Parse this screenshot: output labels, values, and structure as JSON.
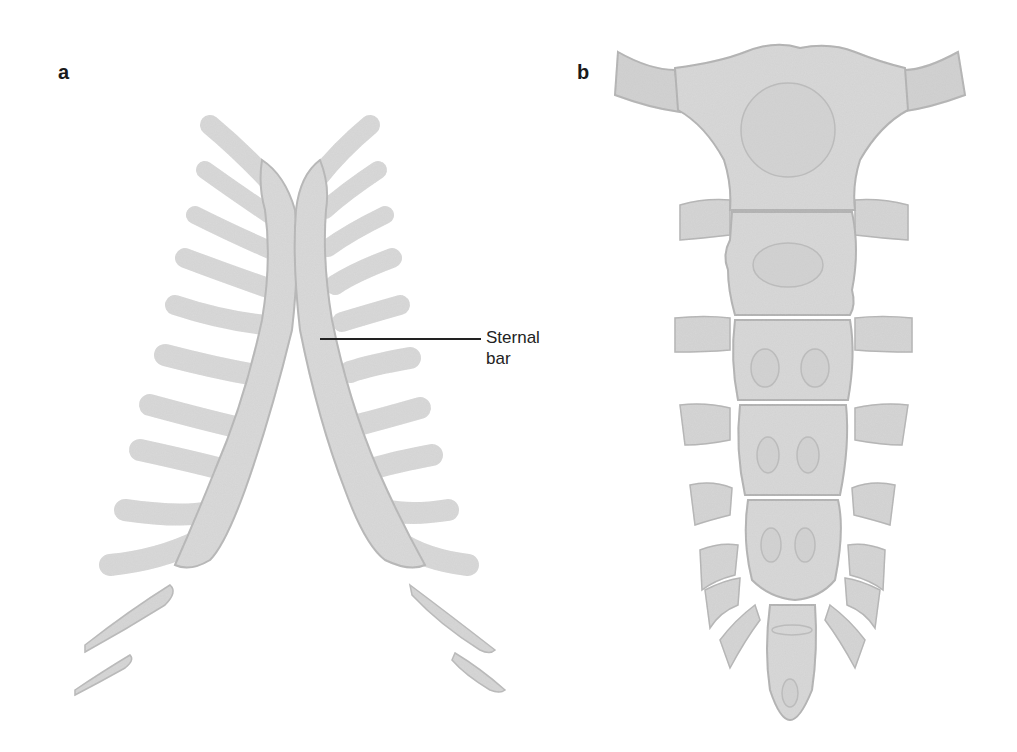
{
  "figure": {
    "panels": [
      {
        "id": "a",
        "label": "a",
        "subject": "paired sternal bars with attached ribs"
      },
      {
        "id": "b",
        "label": "b",
        "subject": "sternum with manubrium, body segments and xiphoid process"
      }
    ],
    "annotations": [
      {
        "panel": "a",
        "line1": "Sternal",
        "line2": "bar"
      }
    ],
    "colors": {
      "bone_fill": "#d9d9d9",
      "bone_shadow": "#a8a8a8",
      "bone_highlight": "#ececec",
      "ossification_outline": "#b4b4b4",
      "leader_line": "#222222",
      "background": "#ffffff"
    },
    "panel_b_segments": [
      {
        "name": "manubrium",
        "ossification_centers": 1
      },
      {
        "name": "sternebra-1",
        "ossification_centers": 1
      },
      {
        "name": "sternebra-2",
        "ossification_centers": 2
      },
      {
        "name": "sternebra-3",
        "ossification_centers": 2
      },
      {
        "name": "sternebra-4",
        "ossification_centers": 2
      },
      {
        "name": "xiphoid",
        "ossification_centers": 1
      }
    ]
  }
}
